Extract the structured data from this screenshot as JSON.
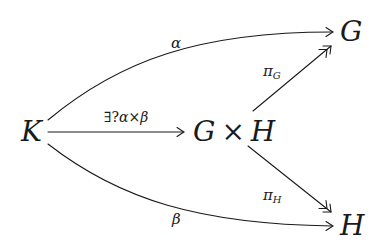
{
  "diagram": {
    "type": "commutative-diagram",
    "nodes": {
      "K": "K",
      "product_left": "G",
      "times": "×",
      "product_right": "H",
      "G": "G",
      "H": "H"
    },
    "arrows": {
      "alpha": {
        "label": "α",
        "from": "K",
        "to": "G",
        "style": "curved, single head"
      },
      "beta": {
        "label": "β",
        "from": "K",
        "to": "H",
        "style": "curved, single head"
      },
      "unique": {
        "label_exists": "∃?",
        "label_alpha": "α",
        "label_times": "×",
        "label_beta": "β",
        "from": "K",
        "to": "G × H",
        "style": "straight, single head"
      },
      "pi_G": {
        "label_main": "π",
        "label_sub": "G",
        "from": "G × H",
        "to": "G",
        "style": "straight, double head"
      },
      "pi_H": {
        "label_main": "π",
        "label_sub": "H",
        "from": "G × H",
        "to": "H",
        "style": "straight, double head"
      }
    }
  }
}
